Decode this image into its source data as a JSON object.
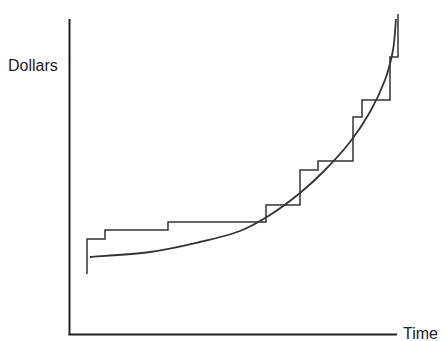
{
  "chart_data": {
    "type": "line",
    "title": "",
    "xlabel": "Time",
    "ylabel": "Dollars",
    "grid": false,
    "legend": null,
    "axes": {
      "x_ticks": [],
      "y_ticks": []
    },
    "series": [
      {
        "name": "step",
        "style": "step",
        "points_px": [
          [
            87,
            274
          ],
          [
            87,
            239
          ],
          [
            105,
            239
          ],
          [
            105,
            230
          ],
          [
            168,
            230
          ],
          [
            168,
            222
          ],
          [
            266,
            222
          ],
          [
            266,
            205
          ],
          [
            300,
            205
          ],
          [
            300,
            170
          ],
          [
            318,
            170
          ],
          [
            318,
            161
          ],
          [
            353,
            161
          ],
          [
            353,
            117
          ],
          [
            362,
            117
          ],
          [
            362,
            100
          ],
          [
            390,
            100
          ],
          [
            390,
            57
          ],
          [
            398,
            57
          ],
          [
            398,
            14
          ]
        ]
      },
      {
        "name": "curve",
        "style": "smooth",
        "points_px": [
          [
            90,
            257
          ],
          [
            150,
            252
          ],
          [
            200,
            242
          ],
          [
            240,
            231
          ],
          [
            270,
            215
          ],
          [
            300,
            193
          ],
          [
            325,
            170
          ],
          [
            350,
            142
          ],
          [
            370,
            112
          ],
          [
            385,
            80
          ],
          [
            393,
            50
          ],
          [
            396,
            19
          ]
        ]
      }
    ]
  },
  "labels": {
    "y": "Dollars",
    "x": "Time"
  },
  "colors": {
    "line": "#333333",
    "axis": "#222222"
  }
}
